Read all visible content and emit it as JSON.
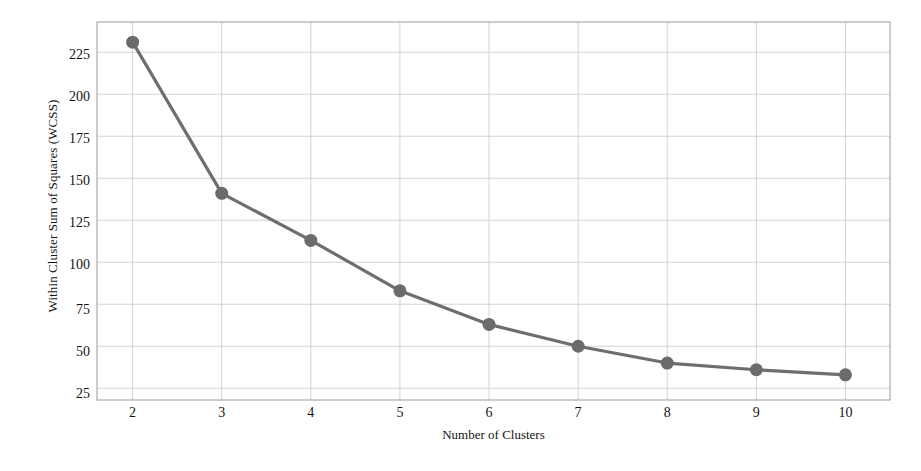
{
  "chart_data": {
    "type": "line",
    "title": "",
    "xlabel": "Number of Clusters",
    "ylabel": "Within Cluster Sum of Squares (WCSS)",
    "x": [
      2,
      3,
      4,
      5,
      6,
      7,
      8,
      9,
      10
    ],
    "values": [
      231,
      141,
      113,
      83,
      63,
      50,
      40,
      36,
      33
    ],
    "series": [
      {
        "name": "WCSS",
        "values": [
          231,
          141,
          113,
          83,
          63,
          50,
          40,
          36,
          33
        ]
      }
    ],
    "xtick_labels": [
      "2",
      "3",
      "4",
      "5",
      "6",
      "7",
      "8",
      "9",
      "10"
    ],
    "ytick_labels": [
      "25",
      "50",
      "75",
      "100",
      "125",
      "150",
      "175",
      "200",
      "225"
    ],
    "ytick_values": [
      25,
      50,
      75,
      100,
      125,
      150,
      175,
      200,
      225
    ],
    "xlim": [
      1.6,
      10.5
    ],
    "ylim": [
      18,
      243
    ],
    "grid": true,
    "legend": "none",
    "marker": "circle",
    "line_color": "#6e6e6e",
    "marker_color": "#6b6b6b",
    "grid_color": "#c8c8c8",
    "axis_color": "#9a9a9a",
    "background_color": "#ffffff"
  }
}
